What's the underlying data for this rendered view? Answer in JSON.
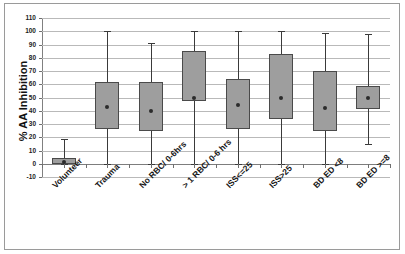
{
  "chart_data": {
    "type": "box",
    "title": "",
    "xlabel": "",
    "ylabel": "% AA Inhibition",
    "ylim": [
      -10,
      110
    ],
    "ytick_step": 10,
    "yticks": [
      110,
      100,
      90,
      80,
      70,
      60,
      50,
      40,
      30,
      20,
      10,
      0,
      -10
    ],
    "grid": true,
    "legend": "none",
    "categories": [
      "Volunteer",
      "Trauma",
      "No RBC/ 0-6hrs",
      "> 1 RBC/ 0-6 hrs",
      "ISS<=25",
      "ISS>25",
      "BD ED <8",
      "BD ED >=8"
    ],
    "boxes": [
      {
        "category": "Volunteer",
        "whisker_low": 0,
        "q1": 0,
        "median": 1,
        "q3": 4,
        "whisker_high": 19
      },
      {
        "category": "Trauma",
        "whisker_low": 0,
        "q1": 26,
        "median": 43,
        "q3": 62,
        "whisker_high": 100
      },
      {
        "category": "No RBC/ 0-6hrs",
        "whisker_low": 0,
        "q1": 25,
        "median": 40,
        "q3": 62,
        "whisker_high": 91
      },
      {
        "category": "> 1 RBC/ 0-6 hrs",
        "whisker_low": 0,
        "q1": 47,
        "median": 50,
        "q3": 85,
        "whisker_high": 100
      },
      {
        "category": "ISS<=25",
        "whisker_low": 0,
        "q1": 26,
        "median": 44,
        "q3": 64,
        "whisker_high": 100
      },
      {
        "category": "ISS>25",
        "whisker_low": 0,
        "q1": 34,
        "median": 50,
        "q3": 83,
        "whisker_high": 100
      },
      {
        "category": "BD ED <8",
        "whisker_low": 0,
        "q1": 25,
        "median": 42,
        "q3": 70,
        "whisker_high": 99
      },
      {
        "category": "BD ED >=8",
        "whisker_low": 15,
        "q1": 41,
        "median": 50,
        "q3": 59,
        "whisker_high": 98
      }
    ],
    "colors": {
      "box_fill": "#9e9e9e",
      "box_edge": "#4a4a4a",
      "whisker": "#3a3a3a",
      "median_dot": "#2b2b2b",
      "gridline": "#b9b9b9",
      "axis": "#7d7d7d",
      "text": "#151515",
      "background": "#ffffff"
    }
  }
}
